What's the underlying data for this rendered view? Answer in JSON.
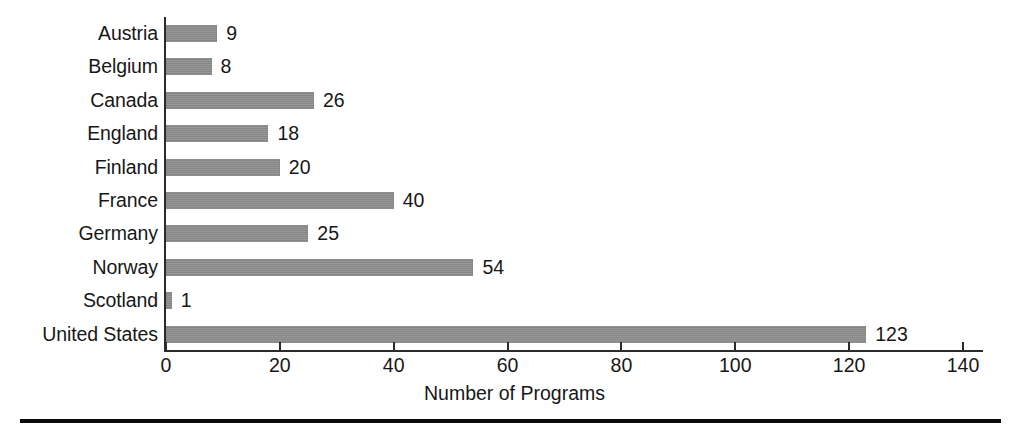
{
  "figure": {
    "background_color": "#ffffff",
    "bar_color": "#8c8c8c",
    "axis_color": "#2b2b2b",
    "text_color": "#171717",
    "rule_color": "#0b0b0b"
  },
  "chart_data": {
    "type": "bar",
    "orientation": "horizontal",
    "title": "",
    "subtitle": "",
    "xlabel": "Number of Programs",
    "ylabel": "",
    "xlim": [
      0,
      140
    ],
    "ylim": null,
    "grid": false,
    "legend": null,
    "legend_position": "none",
    "xticks": [
      0,
      20,
      40,
      60,
      80,
      100,
      120,
      140
    ],
    "xtick_labels": [
      "0",
      "20",
      "40",
      "60",
      "80",
      "100",
      "120",
      "140"
    ],
    "categories": [
      "Austria",
      "Belgium",
      "Canada",
      "England",
      "Finland",
      "France",
      "Germany",
      "Norway",
      "Scotland",
      "United States"
    ],
    "values": [
      9,
      8,
      26,
      18,
      20,
      40,
      25,
      54,
      1,
      123
    ],
    "value_labels": [
      "9",
      "8",
      "26",
      "18",
      "20",
      "40",
      "25",
      "54",
      "1",
      "123"
    ],
    "bars": [
      {
        "category": "Austria",
        "value": 9,
        "label": "9"
      },
      {
        "category": "Belgium",
        "value": 8,
        "label": "8"
      },
      {
        "category": "Canada",
        "value": 26,
        "label": "26"
      },
      {
        "category": "England",
        "value": 18,
        "label": "18"
      },
      {
        "category": "Finland",
        "value": 20,
        "label": "20"
      },
      {
        "category": "France",
        "value": 40,
        "label": "40"
      },
      {
        "category": "Germany",
        "value": 25,
        "label": "25"
      },
      {
        "category": "Norway",
        "value": 54,
        "label": "54"
      },
      {
        "category": "Scotland",
        "value": 1,
        "label": "1"
      },
      {
        "category": "United States",
        "value": 123,
        "label": "123"
      }
    ]
  }
}
